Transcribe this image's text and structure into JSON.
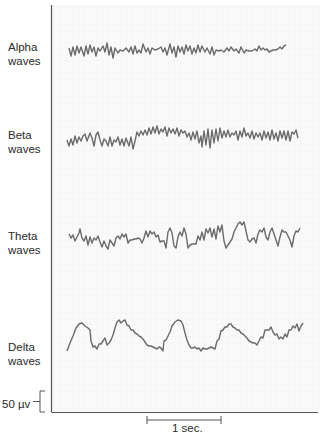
{
  "figure": {
    "waves": [
      {
        "name": "alpha",
        "label_line1": "Alpha",
        "label_line2": "waves"
      },
      {
        "name": "beta",
        "label_line1": "Beta",
        "label_line2": "waves"
      },
      {
        "name": "theta",
        "label_line1": "Theta",
        "label_line2": "waves"
      },
      {
        "name": "delta",
        "label_line1": "Delta",
        "label_line2": "waves"
      }
    ],
    "scale_bars": {
      "voltage_label": "50 µv",
      "time_label": "1 sec."
    },
    "colors": {
      "trace": "#6b6b6b",
      "axis": "#555555",
      "grid": "#eeeeee",
      "background": "#f9f9f9"
    }
  }
}
